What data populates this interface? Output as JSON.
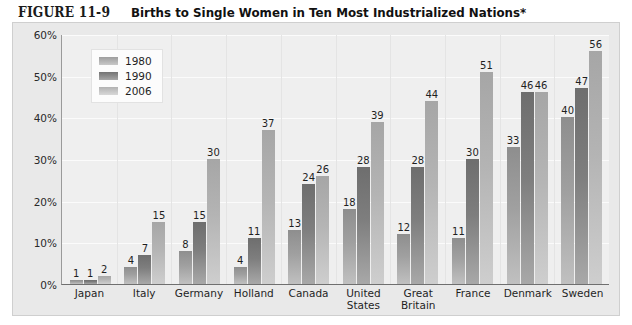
{
  "figure": {
    "number": "FIGURE 11-9",
    "title": "Births to Single Women in Ten Most Industrialized Nations*"
  },
  "chart_data": {
    "type": "bar",
    "title": "Births to Single Women in Ten Most Industrialized Nations*",
    "xlabel": "",
    "ylabel": "",
    "ylim": [
      0,
      60
    ],
    "ytick_labels": [
      "0%",
      "10%",
      "20%",
      "30%",
      "40%",
      "50%",
      "60%"
    ],
    "ytick_values": [
      0,
      10,
      20,
      30,
      40,
      50,
      60
    ],
    "grid": true,
    "legend_position": "top-left",
    "categories": [
      "Japan",
      "Italy",
      "Germany",
      "Holland",
      "Canada",
      "United States",
      "Great Britain",
      "France",
      "Denmark",
      "Sweden"
    ],
    "series": [
      {
        "name": "1980",
        "color": "#9d9d9d",
        "values": [
          1,
          4,
          8,
          4,
          13,
          18,
          12,
          11,
          33,
          40
        ]
      },
      {
        "name": "1990",
        "color": "#737373",
        "values": [
          1,
          7,
          15,
          11,
          24,
          28,
          28,
          30,
          46,
          47
        ]
      },
      {
        "name": "2006",
        "color": "#b2b2b2",
        "values": [
          2,
          15,
          30,
          37,
          26,
          39,
          44,
          51,
          46,
          56
        ]
      }
    ]
  },
  "legend": {
    "items": [
      {
        "label": "1980"
      },
      {
        "label": "1990"
      },
      {
        "label": "2006"
      }
    ]
  },
  "colors": {
    "page_background": "#ffffff",
    "panel_background": "#e9e9e9",
    "plot_background": "#efefef",
    "gridline": "#fbfbfb",
    "axis": "#6f6f6f",
    "text": "#1f1f1f"
  }
}
